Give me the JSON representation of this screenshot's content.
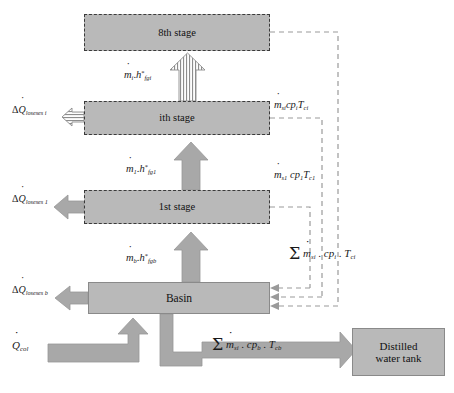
{
  "diagram": {
    "colors": {
      "box_fill": "#b9b9b9",
      "box_dashed_border": "#3a3a3a",
      "box_solid_border": "#8a8a8a",
      "arrow_fill": "#a8a8a8",
      "arrow_stroke": "#8f8f8f",
      "dashed_line": "#9a9a9a",
      "text": "#1a1a1a"
    },
    "boxes": [
      {
        "id": "stage8",
        "label": "8th stage",
        "x": 84,
        "y": 14,
        "w": 186,
        "h": 37,
        "border": "dashed"
      },
      {
        "id": "stagei",
        "label": "ith stage",
        "x": 84,
        "y": 101,
        "w": 186,
        "h": 34,
        "border": "dashed"
      },
      {
        "id": "stage1",
        "label": "1st stage",
        "x": 84,
        "y": 190,
        "w": 186,
        "h": 34,
        "border": "dashed"
      },
      {
        "id": "basin",
        "label": "Basin",
        "x": 88,
        "y": 282,
        "w": 182,
        "h": 32,
        "border": "solid"
      },
      {
        "id": "tank",
        "label": "Distilled\nwater tank",
        "x": 352,
        "y": 328,
        "w": 93,
        "h": 48,
        "border": "solid"
      }
    ],
    "labels": {
      "loss_i": {
        "text": "ΔQ̇loseses i",
        "x": 14,
        "y": 106
      },
      "loss_1": {
        "text": "ΔQ̇loseses 1",
        "x": 14,
        "y": 194
      },
      "loss_b": {
        "text": "ΔQ̇loseses b",
        "x": 14,
        "y": 284
      },
      "mdot_i": {
        "text": "ṁi.h*fgi",
        "x": 125,
        "y": 70
      },
      "mdot_1": {
        "text": "ṁ1.h*fg1",
        "x": 126,
        "y": 164
      },
      "mdot_b": {
        "text": "ṁb.h*fgb",
        "x": 126,
        "y": 253
      },
      "msi_cpi": {
        "text": "ṁsicpiTci",
        "x": 274,
        "y": 101
      },
      "ms1_cp1": {
        "text": "ṁs1cp1Tc1",
        "x": 274,
        "y": 171
      },
      "sum_i": {
        "text": "Σ ṁsi . cpi . Tci",
        "x": 289,
        "y": 247
      },
      "sum_b": {
        "text": "Σ ṁsi . cpb . Tcb",
        "x": 212,
        "y": 338
      },
      "q_col": {
        "text": "Q̇col",
        "x": 12,
        "y": 341
      }
    },
    "flows": [
      {
        "id": "flow-basin-to-stage1",
        "type": "solid-arrow",
        "direction": "up",
        "from": "basin",
        "to": "stage1"
      },
      {
        "id": "flow-stage1-to-stagei",
        "type": "solid-arrow",
        "direction": "up",
        "from": "stage1",
        "to": "stagei"
      },
      {
        "id": "flow-stagei-to-stage8",
        "type": "hatched-arrow",
        "direction": "up",
        "from": "stagei",
        "to": "stage8"
      },
      {
        "id": "loss-stagei-arrow",
        "type": "hatched-arrow",
        "direction": "left",
        "from": "stagei",
        "to": "loss_i"
      },
      {
        "id": "loss-stage1-arrow",
        "type": "solid-arrow",
        "direction": "left",
        "from": "stage1",
        "to": "loss_1"
      },
      {
        "id": "loss-basin-arrow",
        "type": "solid-arrow",
        "direction": "left",
        "from": "basin",
        "to": "loss_b"
      },
      {
        "id": "qcol-inlet-arrow",
        "type": "solid-arrow",
        "direction": "up",
        "from": "q_col",
        "to": "basin"
      },
      {
        "id": "basin-outlet-arrow",
        "type": "solid-arrow",
        "direction": "right",
        "from": "basin",
        "to": "tank"
      },
      {
        "id": "return-stage8",
        "type": "dashed-line",
        "direction": "down",
        "from": "stage8",
        "to": "basin"
      },
      {
        "id": "return-stagei",
        "type": "dashed-line",
        "direction": "down",
        "from": "stagei",
        "to": "basin"
      },
      {
        "id": "return-stage1",
        "type": "dashed-line",
        "direction": "down",
        "from": "stage1",
        "to": "basin"
      }
    ]
  }
}
